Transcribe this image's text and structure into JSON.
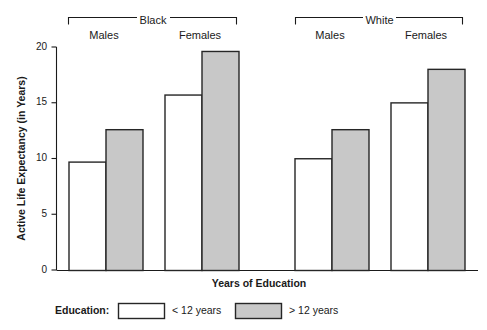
{
  "chart_data": {
    "type": "bar",
    "title": "",
    "xlabel": "Years of Education",
    "ylabel": "Active Life Expectancy (in Years)",
    "ylim": [
      0,
      20
    ],
    "yticks": [
      0,
      5,
      10,
      15,
      20
    ],
    "ytick_labels": [
      "0",
      "5",
      "10",
      "15",
      "20"
    ],
    "grid": false,
    "legend_position": "bottom",
    "group_brackets": [
      {
        "label": "Black",
        "subgroups": [
          "Males",
          "Females"
        ]
      },
      {
        "label": "White",
        "subgroups": [
          "Males",
          "Females"
        ]
      }
    ],
    "categories": [
      "Black Males",
      "Black Females",
      "White Males",
      "White Females"
    ],
    "series": [
      {
        "name": "< 12 years",
        "color": "#ffffff",
        "values": [
          9.7,
          15.7,
          10.0,
          15.0
        ]
      },
      {
        "name": "> 12 years",
        "color": "#c8c8c8",
        "values": [
          12.6,
          19.6,
          12.6,
          18.0
        ]
      }
    ]
  },
  "axes": {
    "y_title": "Active Life Expectancy (in Years)",
    "x_title": "Years of Education",
    "ticks": {
      "t0": "0",
      "t5": "5",
      "t10": "10",
      "t15": "15",
      "t20": "20"
    }
  },
  "brackets": {
    "black": {
      "label": "Black",
      "males": "Males",
      "females": "Females"
    },
    "white": {
      "label": "White",
      "males": "Males",
      "females": "Females"
    }
  },
  "legend": {
    "title": "Education:",
    "item1_label": "< 12 years",
    "item2_label": "> 12 years",
    "item1_color": "#ffffff",
    "item2_color": "#c8c8c8"
  },
  "colors": {
    "bar_fill_light": "#ffffff",
    "bar_fill_dark": "#c8c8c8",
    "bar_stroke": "#262626",
    "axis": "#1a1a1a",
    "background": "#ffffff"
  }
}
